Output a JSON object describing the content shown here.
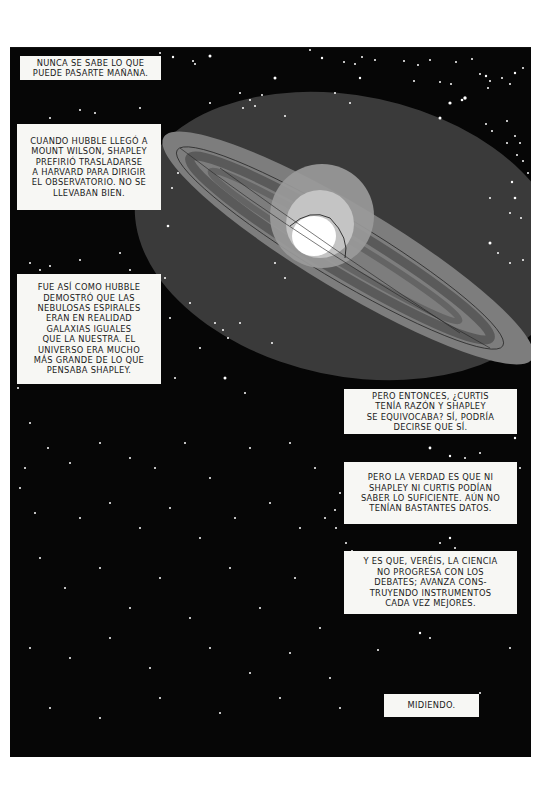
{
  "page": {
    "background": "#ffffff",
    "panel_color": "#060606"
  },
  "captions": [
    {
      "id": "c1",
      "text": "NUNCA SE SABE LO QUE\nPUEDE PASARTE MAÑANA."
    },
    {
      "id": "c2",
      "text": "CUANDO HUBBLE LLEGÓ A\nMOUNT WILSON, SHAPLEY\nPREFIRIÓ TRASLADARSE\nA HARVARD PARA DIRIGIR\nEL OBSERVATORIO. NO SE\nLLEVABAN BIEN."
    },
    {
      "id": "c3",
      "text": "FUE ASÍ COMO HUBBLE\nDEMOSTRÓ QUE LAS\nNEBULOSAS ESPIRALES\nERAN EN REALIDAD\nGALAXIAS IGUALES\nQUE LA NUESTRA. EL\nUNIVERSO ERA MUCHO\nMÁS GRANDE DE LO QUE\nPENSABA SHAPLEY."
    },
    {
      "id": "c4",
      "text": "PERO ENTONCES, ¿CURTIS\nTENÍA RAZÓN Y SHAPLEY\nSE EQUIVOCABA? SÍ, PODRÍA\nDECIRSE QUE SÍ."
    },
    {
      "id": "c5",
      "text": "PERO LA VERDAD ES QUE NI\nSHAPLEY NI CURTIS PODÍAN\nSABER LO SUFICIENTE. AÚN NO\nTENÍAN BASTANTES DATOS."
    },
    {
      "id": "c6",
      "text": "Y ES QUE, VERÉIS, LA CIENCIA\nNO PROGRESA CON LOS\nDEBATES; AVANZA CONS-\nTRUYENDO INSTRUMENTOS\nCADA VEZ MEJORES."
    },
    {
      "id": "c7",
      "text": "MIDIENDO."
    }
  ],
  "illustration": {
    "subject": "spiral-galaxy",
    "colors": {
      "halo": "#3a3a3a",
      "disk": "#7d7d7d",
      "arm_dark": "#5a5a5a",
      "bulge_outer": "#9a9a9a",
      "bulge_inner": "#c4c4c4",
      "core": "#ffffff",
      "star": "#ffffff"
    }
  }
}
